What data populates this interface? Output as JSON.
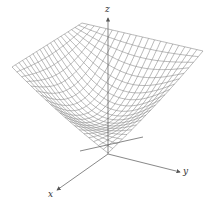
{
  "figure": {
    "surface_function": "z = x^2 + y^2",
    "grid_lines_per_side": 20,
    "line_color": "#8a8a8a",
    "axis_color": "#555555"
  },
  "axes": {
    "x_label": "x",
    "y_label": "y",
    "z_label": "z"
  }
}
